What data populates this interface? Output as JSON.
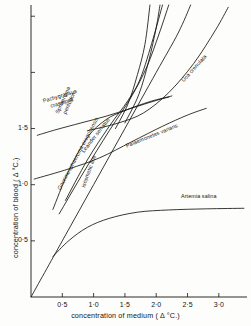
{
  "chart_data": {
    "type": "line",
    "title": "",
    "xlabel": "concentration of medium ( Δ °C.)",
    "ylabel": "concentration of blood ( Δ °C.)",
    "xlim": [
      0,
      3.45
    ],
    "ylim": [
      0,
      2.6
    ],
    "grid": false,
    "legend": "inline-curve-labels",
    "xticks": [
      "0·5",
      "1·0",
      "1·5",
      "2·0",
      "2·5",
      "3·0"
    ],
    "xtick_values": [
      0.5,
      1.0,
      1.5,
      2.0,
      2.5,
      3.0
    ],
    "yticks": [
      "0·5",
      "1·0",
      "1·5"
    ],
    "ytick_values": [
      0.5,
      1.0,
      1.5
    ],
    "ytick_unlabeled_values": [
      2.0,
      2.5
    ],
    "series": [
      {
        "name": "isosmotic line",
        "label": "isosmotic line",
        "style": "straight-diagonal",
        "points": [
          [
            0.0,
            0.0
          ],
          [
            0.5,
            0.5
          ],
          [
            1.0,
            1.0
          ],
          [
            1.5,
            1.5
          ],
          [
            2.0,
            2.0
          ],
          [
            2.35,
            2.35
          ],
          [
            2.55,
            2.6
          ]
        ]
      },
      {
        "name": "Pachygrapsus crassipes",
        "label": "Pachygrapsus crassipes",
        "points": [
          [
            0.1,
            1.44
          ],
          [
            0.4,
            1.49
          ],
          [
            0.8,
            1.55
          ],
          [
            1.2,
            1.61
          ],
          [
            1.6,
            1.68
          ],
          [
            2.0,
            1.75
          ],
          [
            2.2,
            1.78
          ]
        ]
      },
      {
        "name": "Sphaeroma pentodon",
        "label": "Sphaeroma pentodon",
        "points": [
          [
            0.35,
            0.78
          ],
          [
            0.6,
            1.12
          ],
          [
            0.9,
            1.42
          ],
          [
            1.2,
            1.58
          ],
          [
            1.5,
            1.66
          ],
          [
            1.9,
            1.74
          ],
          [
            2.25,
            1.79
          ]
        ]
      },
      {
        "name": "Leander serratus",
        "label": "Leander serratus",
        "points": [
          [
            0.55,
            0.86
          ],
          [
            0.9,
            1.22
          ],
          [
            1.25,
            1.52
          ],
          [
            1.55,
            1.75
          ],
          [
            1.75,
            1.95
          ],
          [
            1.95,
            2.3
          ],
          [
            2.1,
            2.6
          ]
        ]
      },
      {
        "name": "Gnorimosphaeroma oregonensis",
        "label": "Gnorimosphaeroma oregonensis",
        "points": [
          [
            0.45,
            0.74
          ],
          [
            0.85,
            1.12
          ],
          [
            1.25,
            1.48
          ],
          [
            1.6,
            1.78
          ],
          [
            1.85,
            2.05
          ],
          [
            2.05,
            2.35
          ],
          [
            2.2,
            2.6
          ]
        ]
      },
      {
        "name": "Palaemonetes varians",
        "label": "Palaemonetes varians",
        "points": [
          [
            0.05,
            1.05
          ],
          [
            0.6,
            1.14
          ],
          [
            1.1,
            1.24
          ],
          [
            1.6,
            1.38
          ],
          [
            2.1,
            1.52
          ],
          [
            2.5,
            1.62
          ],
          [
            2.8,
            1.68
          ]
        ]
      },
      {
        "name": "Uca crenulata",
        "label": "Uca crenulata",
        "points": [
          [
            0.9,
            1.48
          ],
          [
            1.4,
            1.55
          ],
          [
            1.8,
            1.64
          ],
          [
            2.2,
            1.82
          ],
          [
            2.6,
            2.08
          ],
          [
            2.95,
            2.38
          ],
          [
            3.15,
            2.58
          ]
        ]
      },
      {
        "name": "Artemia salina",
        "label": "Artemia salina",
        "points": [
          [
            0.35,
            0.36
          ],
          [
            0.6,
            0.5
          ],
          [
            0.9,
            0.62
          ],
          [
            1.25,
            0.7
          ],
          [
            1.7,
            0.755
          ],
          [
            2.2,
            0.775
          ],
          [
            2.8,
            0.785
          ],
          [
            3.4,
            0.79
          ]
        ]
      },
      {
        "name": "steep-curve-upper-a",
        "label": "",
        "points": [
          [
            1.35,
            1.5
          ],
          [
            1.55,
            1.72
          ],
          [
            1.7,
            1.98
          ],
          [
            1.82,
            2.25
          ],
          [
            1.9,
            2.6
          ]
        ]
      },
      {
        "name": "steep-curve-upper-b",
        "label": "",
        "points": [
          [
            1.5,
            1.55
          ],
          [
            1.72,
            1.8
          ],
          [
            1.88,
            2.1
          ],
          [
            2.0,
            2.4
          ],
          [
            2.06,
            2.6
          ]
        ]
      }
    ]
  },
  "axes": {
    "x_title": "concentration of medium ( Δ °C.)",
    "y_title": "concentration of blood ( Δ °C.)"
  },
  "colors": {
    "ink": "#15150f",
    "background": "#fdfdfb"
  }
}
